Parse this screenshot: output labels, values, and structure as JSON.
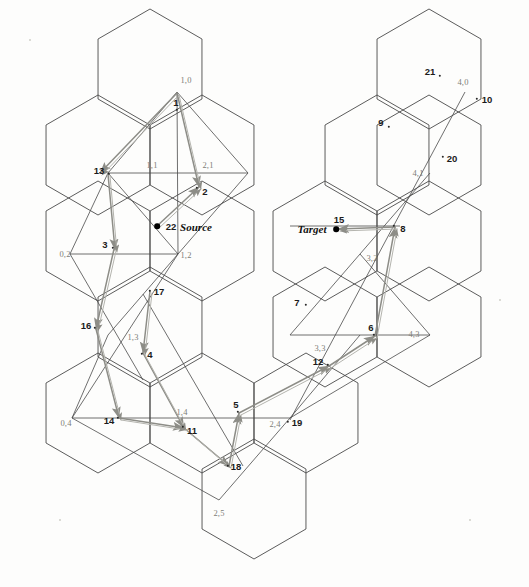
{
  "figure": {
    "width": 529,
    "height": 587,
    "background": "#fdfdfc",
    "hex_line_color": "#4a4a4a",
    "arrow_color": "#8d8d87",
    "path_color": "#555555",
    "grid_label_color": "#7e7e78",
    "node_label_color": "#1b1b1b"
  },
  "roles": [
    {
      "name": "source",
      "label": "Source",
      "number": "22",
      "x": 196,
      "y": 227,
      "dot_x": 157,
      "dot_y": 226,
      "num_x": 171,
      "num_y": 227
    },
    {
      "name": "target",
      "label": "Target",
      "number": "15",
      "x": 312,
      "y": 229,
      "dot_x": 336,
      "dot_y": 229,
      "num_x": 339,
      "num_y": 220
    }
  ],
  "grid_labels": [
    {
      "text": "1,0",
      "x": 186,
      "y": 80
    },
    {
      "text": "1,1",
      "x": 152,
      "y": 165
    },
    {
      "text": "2,1",
      "x": 208,
      "y": 165
    },
    {
      "text": "0,2",
      "x": 65,
      "y": 254
    },
    {
      "text": "1,2",
      "x": 186,
      "y": 255
    },
    {
      "text": "1,3",
      "x": 133,
      "y": 337
    },
    {
      "text": "1,4",
      "x": 182,
      "y": 412
    },
    {
      "text": "2,4",
      "x": 275,
      "y": 424
    },
    {
      "text": "0,4",
      "x": 66,
      "y": 423
    },
    {
      "text": "2,5",
      "x": 219,
      "y": 513
    },
    {
      "text": "4,0",
      "x": 463,
      "y": 82
    },
    {
      "text": "4,1",
      "x": 418,
      "y": 173
    },
    {
      "text": "3,2",
      "x": 372,
      "y": 258
    },
    {
      "text": "3,3",
      "x": 320,
      "y": 348
    },
    {
      "text": "4,3",
      "x": 414,
      "y": 334
    }
  ],
  "nodes": [
    {
      "id": "1",
      "label": "1",
      "label_x": 176,
      "label_y": 103,
      "dot_x": 177,
      "dot_y": 110
    },
    {
      "id": "2",
      "label": "2",
      "label_x": 205,
      "label_y": 192,
      "dot_x": 197,
      "dot_y": 188
    },
    {
      "id": "3",
      "label": "3",
      "label_x": 105,
      "label_y": 245,
      "dot_x": 113,
      "dot_y": 248
    },
    {
      "id": "4",
      "label": "4",
      "label_x": 150,
      "label_y": 355,
      "dot_x": 142,
      "dot_y": 354
    },
    {
      "id": "5",
      "label": "5",
      "label_x": 236,
      "label_y": 405,
      "dot_x": 238,
      "dot_y": 412
    },
    {
      "id": "6",
      "label": "6",
      "label_x": 371,
      "label_y": 328,
      "dot_x": 374,
      "dot_y": 335
    },
    {
      "id": "7",
      "label": "7",
      "label_x": 297,
      "label_y": 303,
      "dot_x": 306,
      "dot_y": 305
    },
    {
      "id": "8",
      "label": "8",
      "label_x": 403,
      "label_y": 229,
      "dot_x": 394,
      "dot_y": 226
    },
    {
      "id": "9",
      "label": "9",
      "label_x": 381,
      "label_y": 123,
      "dot_x": 389,
      "dot_y": 127
    },
    {
      "id": "10",
      "label": "10",
      "label_x": 487,
      "label_y": 100,
      "dot_x": 477,
      "dot_y": 99
    },
    {
      "id": "11",
      "label": "11",
      "label_x": 192,
      "label_y": 431,
      "dot_x": 183,
      "dot_y": 427
    },
    {
      "id": "12",
      "label": "12",
      "label_x": 318,
      "label_y": 362,
      "dot_x": 328,
      "dot_y": 365
    },
    {
      "id": "13",
      "label": "13",
      "label_x": 99,
      "label_y": 171,
      "dot_x": 109,
      "dot_y": 174
    },
    {
      "id": "14",
      "label": "14",
      "label_x": 109,
      "label_y": 421,
      "dot_x": 118,
      "dot_y": 418
    },
    {
      "id": "16",
      "label": "16",
      "label_x": 86,
      "label_y": 326,
      "dot_x": 95,
      "dot_y": 328
    },
    {
      "id": "17",
      "label": "17",
      "label_x": 159,
      "label_y": 292,
      "dot_x": 150,
      "dot_y": 291
    },
    {
      "id": "18",
      "label": "18",
      "label_x": 236,
      "label_y": 467,
      "dot_x": 228,
      "dot_y": 466
    },
    {
      "id": "19",
      "label": "19",
      "label_x": 297,
      "label_y": 423,
      "dot_x": 288,
      "dot_y": 422
    },
    {
      "id": "20",
      "label": "20",
      "label_x": 452,
      "label_y": 159,
      "dot_x": 443,
      "dot_y": 157
    },
    {
      "id": "21",
      "label": "21",
      "label_x": 430,
      "label_y": 72,
      "dot_x": 440,
      "dot_y": 76
    }
  ],
  "hexagons": [
    {
      "name": "hex-1-0",
      "cx": 150,
      "cy": 69
    },
    {
      "name": "hex-0-1",
      "cx": 98,
      "cy": 155
    },
    {
      "name": "hex-1-1",
      "cx": 202,
      "cy": 155
    },
    {
      "name": "hex-0-2",
      "cx": 98,
      "cy": 241
    },
    {
      "name": "hex-1-2",
      "cx": 202,
      "cy": 241
    },
    {
      "name": "hex-1-3",
      "cx": 150,
      "cy": 327
    },
    {
      "name": "hex-0-4",
      "cx": 98,
      "cy": 413
    },
    {
      "name": "hex-1-4",
      "cx": 202,
      "cy": 413
    },
    {
      "name": "hex-2-5",
      "cx": 254,
      "cy": 499
    },
    {
      "name": "hex-4-0",
      "cx": 429,
      "cy": 69
    },
    {
      "name": "hex-3-1",
      "cx": 377,
      "cy": 155
    },
    {
      "name": "hex-4-1",
      "cx": 429,
      "cy": 155
    },
    {
      "name": "hex-3-2",
      "cx": 325,
      "cy": 241
    },
    {
      "name": "hex-4-2",
      "cx": 429,
      "cy": 241
    },
    {
      "name": "hex-3-3",
      "cx": 325,
      "cy": 327
    },
    {
      "name": "hex-4-3",
      "cx": 429,
      "cy": 327
    },
    {
      "name": "hex-2-4b",
      "cx": 306,
      "cy": 413
    }
  ],
  "hex_geometry": {
    "radius": 60,
    "orientation": "pointy-top"
  },
  "path_segments": [
    {
      "name": "path-1-13",
      "x1": 177,
      "y1": 93,
      "x2": 100,
      "y2": 173
    },
    {
      "name": "path-1-2",
      "x1": 177,
      "y1": 93,
      "x2": 199,
      "y2": 187
    },
    {
      "name": "path-13-3",
      "x1": 108,
      "y1": 174,
      "x2": 115,
      "y2": 250
    },
    {
      "name": "path-22-2",
      "x1": 157,
      "y1": 226,
      "x2": 199,
      "y2": 187
    },
    {
      "name": "path-3-16",
      "x1": 114,
      "y1": 249,
      "x2": 96,
      "y2": 329
    },
    {
      "name": "path-17-4",
      "x1": 150,
      "y1": 291,
      "x2": 143,
      "y2": 353
    },
    {
      "name": "path-16-14",
      "x1": 96,
      "y1": 329,
      "x2": 119,
      "y2": 418
    },
    {
      "name": "path-4-11",
      "x1": 143,
      "y1": 353,
      "x2": 184,
      "y2": 428
    },
    {
      "name": "path-14-11",
      "x1": 119,
      "y1": 418,
      "x2": 184,
      "y2": 428
    },
    {
      "name": "path-11-18",
      "x1": 184,
      "y1": 428,
      "x2": 229,
      "y2": 466
    },
    {
      "name": "path-18-5",
      "x1": 229,
      "y1": 466,
      "x2": 239,
      "y2": 413
    },
    {
      "name": "path-5-12",
      "x1": 239,
      "y1": 413,
      "x2": 329,
      "y2": 366
    },
    {
      "name": "path-12-6",
      "x1": 329,
      "y1": 366,
      "x2": 375,
      "y2": 336
    },
    {
      "name": "path-6-8",
      "x1": 375,
      "y1": 336,
      "x2": 395,
      "y2": 227
    },
    {
      "name": "path-8-15",
      "x1": 395,
      "y1": 227,
      "x2": 338,
      "y2": 229
    }
  ],
  "legend_note": ""
}
